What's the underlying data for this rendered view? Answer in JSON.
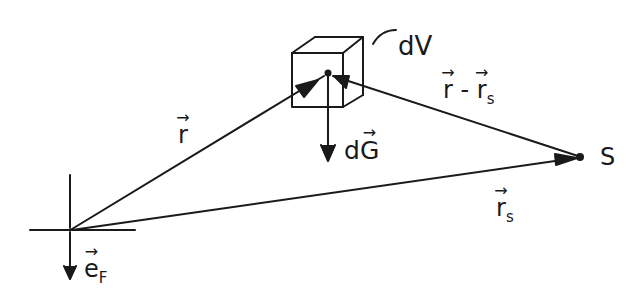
{
  "diagram": {
    "title": "",
    "style": "hand-drawn physics sketch",
    "colors": {
      "ink": "#1a1a1a",
      "background": "#ffffff"
    },
    "nodes": [
      {
        "id": "origin",
        "label": "",
        "kind": "coordinate-cross",
        "x": 70,
        "y": 230
      },
      {
        "id": "volume",
        "label": "dV",
        "kind": "cube",
        "x": 328,
        "y": 73
      },
      {
        "id": "source",
        "label": "S",
        "kind": "point",
        "x": 580,
        "y": 157
      }
    ],
    "edges": [
      {
        "id": "r",
        "from": "origin",
        "to": "volume",
        "label": "r",
        "vector": true
      },
      {
        "id": "rs",
        "from": "origin",
        "to": "source",
        "label": "r",
        "subscript": "s",
        "vector": true
      },
      {
        "id": "r_minus_rs",
        "from": "source",
        "to": "volume",
        "label": "r - r",
        "subscript": "s",
        "vector": true
      },
      {
        "id": "dG",
        "from": "volume",
        "to": "down",
        "label": "dG",
        "vector": true
      },
      {
        "id": "eF",
        "from": "origin",
        "to": "down",
        "label": "e",
        "subscript": "F",
        "vector": true
      }
    ]
  },
  "labels": {
    "dV": "dV",
    "S": "S",
    "r": "r",
    "rs_main": "r",
    "rs_sub": "s",
    "rmrs_a": "r",
    "rmrs_minus": "-",
    "rmrs_b": "r",
    "rmrs_sub": "s",
    "dG_d": "d",
    "dG_G": "G",
    "eF_main": "e",
    "eF_sub": "F"
  }
}
